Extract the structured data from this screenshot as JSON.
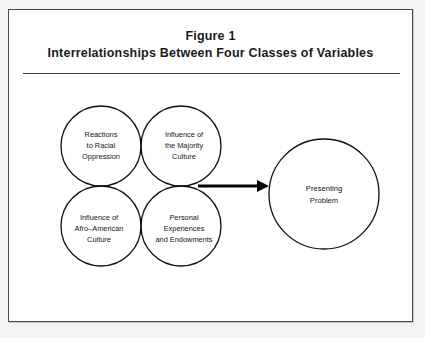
{
  "figure": {
    "number_label": "Figure 1",
    "caption": "Interrelationships Between Four Classes of Variables"
  },
  "diagram": {
    "type": "venn-four-circle-with-outcome",
    "venn_nodes": [
      {
        "id": "reactions-to-racial-oppression",
        "position": "top-left",
        "lines": [
          "Reactions",
          "to  Racial",
          "Oppression"
        ]
      },
      {
        "id": "influence-of-the-majority-culture",
        "position": "top-right",
        "lines": [
          "Influence of",
          "the Majority",
          "Culture"
        ]
      },
      {
        "id": "influence-of-afro-american-culture",
        "position": "bottom-left",
        "lines": [
          "Influence of",
          "Afro–American",
          "Culture"
        ]
      },
      {
        "id": "personal-experiences-and-endowments",
        "position": "bottom-right",
        "lines": [
          "Personal",
          "Experiences",
          "and Endowments"
        ]
      }
    ],
    "outcome_node": {
      "id": "presenting-problem",
      "lines": [
        "Presenting",
        "Problem"
      ]
    },
    "connector": {
      "id": "venn-to-outcome-arrow",
      "style": "solid-arrow",
      "direction": "left-to-right"
    },
    "colors": {
      "stroke": "#101010",
      "text": "#151515",
      "arrow": "#000000",
      "frame": "#4a4a4a",
      "paper": "#ffffff"
    }
  }
}
